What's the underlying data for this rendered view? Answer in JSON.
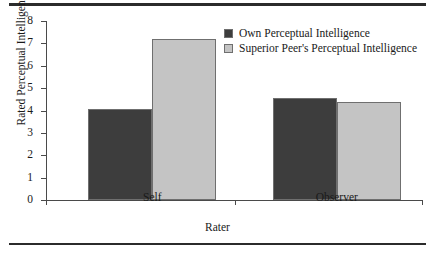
{
  "chart_data": {
    "type": "bar",
    "title": "",
    "xlabel": "Rater",
    "ylabel": "Rated Perceptual Intelligence",
    "categories": [
      "Self",
      "Observer"
    ],
    "series": [
      {
        "name": "Own Perceptual Intelligence",
        "values": [
          4.05,
          4.55
        ],
        "color": "#3d3d3d"
      },
      {
        "name": "Superior Peer's Perceptual Intelligence",
        "values": [
          7.2,
          4.4
        ],
        "color": "#c4c4c4"
      }
    ],
    "ylim": [
      0,
      8
    ],
    "yticks": [
      0,
      1,
      2,
      3,
      4,
      5,
      6,
      7,
      8
    ],
    "ytick_labels": [
      "0",
      "1",
      "2",
      "3",
      "4",
      "5",
      "6",
      "7",
      "8"
    ],
    "grid": false,
    "legend_position": "top-right"
  },
  "figure": {
    "rule_color": "#2b2b2b",
    "axis_color": "#4a4a4a",
    "bar_border_color": "#6f6f6f",
    "background": "#ffffff"
  }
}
